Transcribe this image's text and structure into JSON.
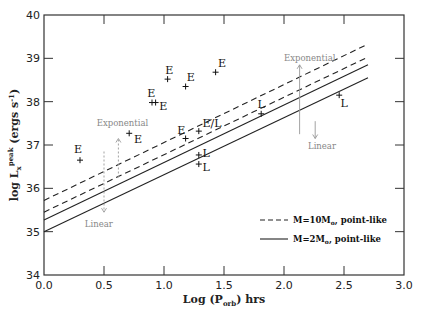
{
  "chart_data": {
    "type": "line",
    "title": "",
    "xlabel": "Log (P_orb) hrs",
    "xlabel_parts": {
      "prefix": "Log (P",
      "sub": "orb",
      "suffix": ") hrs"
    },
    "ylabel": "log L_x^peak (ergs s^-1)",
    "ylabel_parts": {
      "prefix": "log L",
      "sub": "x",
      "sup": "peak",
      "suffix": " (ergs s",
      "unit_sup": "-1",
      "close": ")"
    },
    "xlim": [
      0.0,
      3.0
    ],
    "ylim": [
      34,
      40
    ],
    "xticks": [
      "0.0",
      "0.5",
      "1.0",
      "1.5",
      "2.0",
      "2.5",
      "3.0"
    ],
    "yticks": [
      "34",
      "35",
      "36",
      "37",
      "38",
      "39",
      "40"
    ],
    "grid": false,
    "legend_position": "lower right",
    "series": [
      {
        "name": "M=10M_o, point-like (upper)",
        "style": "dashed",
        "x": [
          0.0,
          2.7
        ],
        "y": [
          35.72,
          39.33
        ]
      },
      {
        "name": "M=10M_o, point-like (lower)",
        "style": "dashed",
        "x": [
          0.0,
          2.7
        ],
        "y": [
          35.45,
          39.03
        ]
      },
      {
        "name": "M=2M_o, point-like (upper)",
        "style": "solid",
        "x": [
          0.0,
          2.7
        ],
        "y": [
          35.27,
          38.85
        ]
      },
      {
        "name": "M=2M_o, point-like (lower)",
        "style": "solid",
        "x": [
          0.0,
          2.7
        ],
        "y": [
          35.0,
          38.55
        ]
      }
    ],
    "points": [
      {
        "x": 0.3,
        "y": 36.65,
        "label": "E",
        "lx": -0.05,
        "ly": 0.25
      },
      {
        "x": 0.71,
        "y": 37.27,
        "label": "E",
        "lx": 0.04,
        "ly": -0.12
      },
      {
        "x": 0.9,
        "y": 37.98,
        "label": "E",
        "lx": -0.04,
        "ly": 0.22
      },
      {
        "x": 0.93,
        "y": 37.98,
        "label": "E",
        "lx": 0.03,
        "ly": -0.08
      },
      {
        "x": 1.03,
        "y": 38.52,
        "label": "E",
        "lx": -0.02,
        "ly": 0.22
      },
      {
        "x": 1.18,
        "y": 38.35,
        "label": "E",
        "lx": 0.01,
        "ly": 0.22
      },
      {
        "x": 1.43,
        "y": 38.68,
        "label": "E",
        "lx": 0.02,
        "ly": 0.22
      },
      {
        "x": 1.18,
        "y": 37.15,
        "label": "E",
        "lx": -0.07,
        "ly": 0.2
      },
      {
        "x": 1.29,
        "y": 37.32,
        "label": "E/L",
        "lx": 0.03,
        "ly": 0.18
      },
      {
        "x": 1.29,
        "y": 36.77,
        "label": "L",
        "lx": 0.03,
        "ly": 0.05
      },
      {
        "x": 1.29,
        "y": 36.56,
        "label": "L",
        "lx": 0.03,
        "ly": -0.06
      },
      {
        "x": 1.81,
        "y": 37.72,
        "label": "L",
        "lx": -0.03,
        "ly": 0.22
      },
      {
        "x": 2.46,
        "y": 38.15,
        "label": "L",
        "lx": 0.01,
        "ly": -0.18
      }
    ],
    "annotations": [
      {
        "text": "Exponential",
        "x": 0.44,
        "y": 37.45,
        "arrow": {
          "x": 0.62,
          "from": 36.25,
          "to": 37.15
        }
      },
      {
        "text": "Linear",
        "x": 0.34,
        "y": 35.1,
        "arrow": {
          "x": 0.5,
          "from": 36.85,
          "to": 35.45
        }
      },
      {
        "text": "Exponential",
        "x": 2.0,
        "y": 38.95,
        "arrow": {
          "x": 2.13,
          "from": 37.25,
          "to": 38.85
        }
      },
      {
        "text": "Linear",
        "x": 2.2,
        "y": 36.9,
        "arrow": {
          "x": 2.26,
          "from": 37.55,
          "to": 37.15
        }
      }
    ],
    "legend": [
      {
        "style": "dashed",
        "label": "M=10M",
        "sub": "o",
        "suffix": ", point-like"
      },
      {
        "style": "solid",
        "label": "M=2M",
        "sub": "o",
        "suffix": ", point-like"
      }
    ]
  },
  "colors": {
    "axis": "#333333",
    "line": "#222222",
    "annotation": "#999999",
    "background": "#ffffff"
  }
}
